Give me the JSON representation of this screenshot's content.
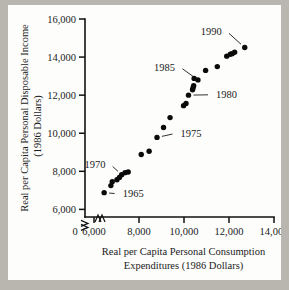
{
  "chart_data": {
    "type": "scatter",
    "title": "",
    "xlabel": "Real per Capita Personal Consumption Expenditures (1986 Dollars)",
    "xlabel_line1": "Real per Capita Personal Consumption",
    "xlabel_line2": "Expenditures (1986 Dollars)",
    "ylabel": "Real per Capita Personal Disposable Income (1986 Dollars)",
    "ylabel_line1": "Real per Capita Personal Disposable Income",
    "ylabel_line2": "(1986 Dollars)",
    "xlim": [
      5600,
      14000
    ],
    "ylim": [
      5600,
      16000
    ],
    "xticks": [
      6000,
      8000,
      10000,
      12000,
      14000
    ],
    "xtick_labels": [
      "6,000",
      "8,000",
      "10,000",
      "12,000",
      "14,000"
    ],
    "yticks": [
      6000,
      8000,
      10000,
      12000,
      14000,
      16000
    ],
    "ytick_labels": [
      "6,000",
      "8,000",
      "10,000",
      "12,000",
      "14,000",
      "16,000"
    ],
    "origin_label": "0",
    "axis_break": true,
    "grid": false,
    "legend": null,
    "marker_color": "#0b0b0b",
    "points": [
      {
        "year": 1965,
        "x": 6450,
        "y": 6880
      },
      {
        "year": 1966,
        "x": 6750,
        "y": 7250
      },
      {
        "year": 1967,
        "x": 6810,
        "y": 7450
      },
      {
        "year": 1968,
        "x": 7020,
        "y": 7560
      },
      {
        "year": 1969,
        "x": 7130,
        "y": 7680
      },
      {
        "year": 1970,
        "x": 7230,
        "y": 7820
      },
      {
        "year": 1971,
        "x": 7380,
        "y": 7930
      },
      {
        "year": 1972,
        "x": 7520,
        "y": 7960
      },
      {
        "year": 1973,
        "x": 8100,
        "y": 8880
      },
      {
        "year": 1974,
        "x": 8450,
        "y": 9050
      },
      {
        "year": 1975,
        "x": 8800,
        "y": 9780
      },
      {
        "year": 1976,
        "x": 9090,
        "y": 10300
      },
      {
        "year": 1977,
        "x": 9380,
        "y": 10820
      },
      {
        "year": 1978,
        "x": 9980,
        "y": 11450
      },
      {
        "year": 1979,
        "x": 10090,
        "y": 11560
      },
      {
        "year": 1980,
        "x": 10200,
        "y": 12000
      },
      {
        "year": 1981,
        "x": 10380,
        "y": 12280
      },
      {
        "year": 1982,
        "x": 10400,
        "y": 12380
      },
      {
        "year": 1983,
        "x": 10430,
        "y": 12500
      },
      {
        "year": 1984,
        "x": 10450,
        "y": 12880
      },
      {
        "year": 1985,
        "x": 10620,
        "y": 12800
      },
      {
        "year": 1986,
        "x": 10960,
        "y": 13300
      },
      {
        "year": 1987,
        "x": 11480,
        "y": 13500
      },
      {
        "year": 1988,
        "x": 11900,
        "y": 14050
      },
      {
        "year": 1989,
        "x": 12060,
        "y": 14150
      },
      {
        "year": 1990,
        "x": 12140,
        "y": 14180
      },
      {
        "year": 1991,
        "x": 12250,
        "y": 14250
      },
      {
        "year": 1992,
        "x": 12700,
        "y": 14500
      }
    ],
    "annotations": [
      {
        "label": "1965",
        "point_year": 1965,
        "text_x": 7050,
        "text_y": 6820
      },
      {
        "label": "1970",
        "point_year": 1970,
        "text_x": 6730,
        "text_y": 8360
      },
      {
        "label": "1975",
        "point_year": 1975,
        "text_x": 9620,
        "text_y": 9990
      },
      {
        "label": "1980",
        "point_year": 1980,
        "text_x": 11200,
        "text_y": 12020
      },
      {
        "label": "1985",
        "point_year": 1985,
        "text_x": 9820,
        "text_y": 13480
      },
      {
        "label": "1990",
        "point_year": 1992,
        "text_x": 11900,
        "text_y": 15350
      }
    ]
  }
}
